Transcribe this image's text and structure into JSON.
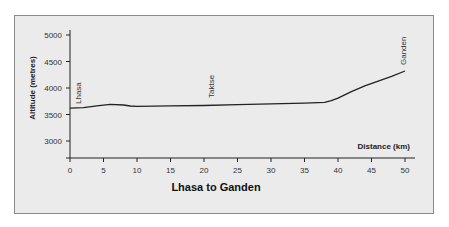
{
  "chart_data": {
    "type": "line",
    "title": "Lhasa to Ganden",
    "xlabel": "Distance (km)",
    "ylabel": "Altitude (metres)",
    "xlim": [
      0,
      50
    ],
    "ylim": [
      2750,
      5050
    ],
    "x_ticks": [
      0,
      5,
      10,
      15,
      20,
      25,
      30,
      35,
      40,
      45,
      50
    ],
    "y_ticks": [
      3000,
      3500,
      4000,
      4500,
      5000
    ],
    "grid": false,
    "series": [
      {
        "name": "Altitude profile",
        "x": [
          0,
          2,
          4,
          6,
          8,
          9,
          10,
          15,
          20,
          25,
          30,
          35,
          38,
          39,
          40,
          42,
          44,
          46,
          48,
          50
        ],
        "values": [
          3620,
          3630,
          3665,
          3690,
          3680,
          3660,
          3655,
          3665,
          3670,
          3685,
          3700,
          3715,
          3730,
          3760,
          3810,
          3930,
          4040,
          4130,
          4220,
          4320
        ]
      }
    ],
    "annotations": [
      {
        "text": "Lhasa",
        "x": 0.5,
        "y": 3620
      },
      {
        "text": "Taktse",
        "x": 21,
        "y": 3670
      },
      {
        "text": "Ganden",
        "x": 50,
        "y": 4320
      }
    ]
  },
  "labels": {
    "title": "Lhasa to Ganden",
    "xlabel": "Distance (km)",
    "ylabel": "Altitude (metres)",
    "place_lhasa": "Lhasa",
    "place_taktse": "Taktse",
    "place_ganden": "Ganden"
  },
  "colors": {
    "background": "#ebebeb",
    "line": "#222222",
    "border": "#8a8a8a"
  }
}
